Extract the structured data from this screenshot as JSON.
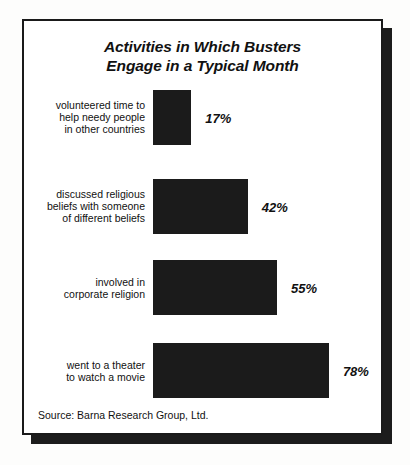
{
  "figure": {
    "title_line1": "Activities in Which Busters",
    "title_line2": "Engage in a Typical Month",
    "source": "Source: Barna Research Group, Ltd.",
    "frame_color": "#1a1a1a",
    "bar_color": "#1b1b1b",
    "text_color": "#111111",
    "background": "#ffffff"
  },
  "chart_data": {
    "type": "bar",
    "orientation": "horizontal",
    "title": "Activities in Which Busters Engage in a Typical Month",
    "subtitle": "",
    "xlabel": "",
    "ylabel": "",
    "xlim": [
      0,
      100
    ],
    "grid": false,
    "legend": false,
    "value_suffix": "%",
    "source": "Source: Barna Research Group, Ltd.",
    "categories": [
      "volunteered time to help needy people in other countries",
      "discussed religious beliefs with someone of different beliefs",
      "involved in corporate religion",
      "went to a theater to watch a movie"
    ],
    "values": [
      17,
      42,
      55,
      78
    ],
    "bars": [
      {
        "label_lines": [
          "volunteered time to",
          "help needy people",
          "in other countries"
        ],
        "value": 17,
        "value_label": "17%"
      },
      {
        "label_lines": [
          "discussed religious",
          "beliefs with someone",
          "of different beliefs"
        ],
        "value": 42,
        "value_label": "42%"
      },
      {
        "label_lines": [
          "involved in",
          "corporate religion"
        ],
        "value": 55,
        "value_label": "55%"
      },
      {
        "label_lines": [
          "went to a theater",
          "to watch a movie"
        ],
        "value": 78,
        "value_label": "78%"
      }
    ]
  }
}
